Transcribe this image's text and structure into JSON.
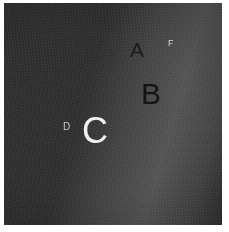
{
  "figure": {
    "medium": "monochrome photographic plate",
    "border_color": "#ffffff",
    "space_color": "#2f2f2f"
  },
  "labels": [
    {
      "id": "a",
      "text": "A",
      "kind": "ring-division",
      "color": "#1c1c1c",
      "size_px": 21,
      "x": 126,
      "y": 36
    },
    {
      "id": "f",
      "text": "F",
      "kind": "ring-division",
      "color": "#d8d8d8",
      "size_px": 9,
      "x": 164,
      "y": 36
    },
    {
      "id": "b",
      "text": "B",
      "kind": "ring-division",
      "color": "#141414",
      "size_px": 30,
      "x": 137,
      "y": 76
    },
    {
      "id": "c",
      "text": "C",
      "kind": "ring-division",
      "color": "#f2f2f2",
      "size_px": 36,
      "x": 78,
      "y": 110
    },
    {
      "id": "d",
      "text": "D",
      "kind": "ring-division",
      "color": "#c9c9c9",
      "size_px": 10,
      "x": 59,
      "y": 119
    }
  ],
  "rings": [
    {
      "name": "F ring",
      "tone": "#8d8d8d",
      "radius": 516,
      "thickness": 3
    },
    {
      "name": "Encke gap",
      "tone": "#4d4d4d",
      "radius": 505,
      "thickness": 4
    },
    {
      "name": "A ring outer",
      "tone": "#a6a6a6",
      "radius": 497,
      "thickness": 12
    },
    {
      "name": "A ring inner",
      "tone": "#9a9a9a",
      "radius": 482,
      "thickness": 16
    },
    {
      "name": "Cassini division",
      "tone": "#3f3f3f",
      "radius": 462,
      "thickness": 16
    },
    {
      "name": "B ring outer",
      "tone": "#efefef",
      "radius": 440,
      "thickness": 22
    },
    {
      "name": "B ring bright",
      "tone": "#e2e2e2",
      "radius": 414,
      "thickness": 26
    },
    {
      "name": "B ring mid",
      "tone": "#cfcfcf",
      "radius": 388,
      "thickness": 24
    },
    {
      "name": "B ring banded",
      "tone": "#dcdcdc",
      "radius": 364,
      "thickness": 20
    },
    {
      "name": "B ring inner",
      "tone": "#c2c2c2",
      "radius": 342,
      "thickness": 22
    },
    {
      "name": "B/C boundary",
      "tone": "#a8a8a8",
      "radius": 320,
      "thickness": 20
    },
    {
      "name": "C ring outer",
      "tone": "#7b7b7b",
      "radius": 300,
      "thickness": 20
    },
    {
      "name": "C ring",
      "tone": "#5a5a5a",
      "radius": 276,
      "thickness": 28
    },
    {
      "name": "C ring inner",
      "tone": "#474747",
      "radius": 244,
      "thickness": 36
    },
    {
      "name": "D ring",
      "tone": "#3a3a3a",
      "radius": 200,
      "thickness": 52
    },
    {
      "name": "inner void",
      "tone": "#343434",
      "radius": 140,
      "thickness": 70
    }
  ],
  "geometry": {
    "rotation_deg": -16.5,
    "y_squash": 0.1725,
    "center_x": 230,
    "center_y": 412
  }
}
